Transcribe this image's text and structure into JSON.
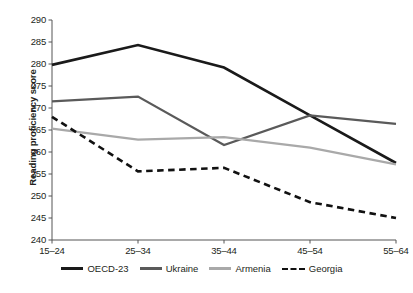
{
  "chart_data": {
    "type": "line",
    "title": "",
    "xlabel": "",
    "ylabel": "Reading proficiency score",
    "categories": [
      "15–24",
      "25–34",
      "35–44",
      "45–54",
      "55–64"
    ],
    "ylim": [
      240,
      290
    ],
    "yticks": [
      240,
      245,
      250,
      255,
      260,
      265,
      270,
      275,
      280,
      285,
      290
    ],
    "grid": false,
    "legend_position": "bottom",
    "series": [
      {
        "name": "OECD-23",
        "color": "#1a1a1a",
        "style": "solid",
        "width": 2.6,
        "values": [
          279.8,
          284.3,
          279.2,
          268.3,
          257.5
        ]
      },
      {
        "name": "Ukraine",
        "color": "#5a5a5a",
        "style": "solid",
        "width": 2.2,
        "values": [
          271.5,
          272.6,
          261.6,
          268.3,
          266.4
        ]
      },
      {
        "name": "Armenia",
        "color": "#a9a9a9",
        "style": "solid",
        "width": 2.2,
        "values": [
          265.3,
          262.8,
          263.4,
          261.0,
          257.2
        ]
      },
      {
        "name": "Georgia",
        "color": "#111111",
        "style": "dashed",
        "width": 2.6,
        "values": [
          268.0,
          255.6,
          256.4,
          248.6,
          245.0
        ]
      }
    ]
  },
  "axis": {
    "y_title": "Reading proficiency score",
    "y_tick_labels": [
      "290",
      "285",
      "280",
      "275",
      "270",
      "265",
      "260",
      "255",
      "250",
      "245",
      "240"
    ],
    "x_tick_labels": [
      "15–24",
      "25–34",
      "35–44",
      "45–54",
      "55–64"
    ]
  },
  "legend": {
    "items": [
      {
        "label": "OECD-23"
      },
      {
        "label": "Ukraine"
      },
      {
        "label": "Armenia"
      },
      {
        "label": "Georgia"
      }
    ]
  }
}
